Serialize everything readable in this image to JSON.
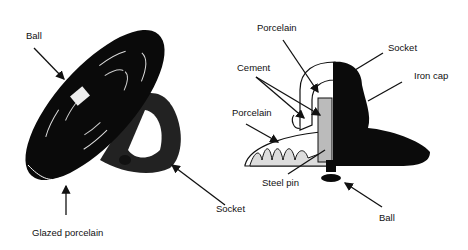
{
  "left_figure": {
    "title": "Suspension insulator (external view)",
    "labels": {
      "ball": "Ball",
      "glazed_porcelain": "Glazed porcelain",
      "socket": "Socket"
    }
  },
  "right_figure": {
    "title": "Suspension insulator (cross-section)",
    "labels": {
      "porcelain_top": "Porcelain",
      "socket": "Socket",
      "cement": "Cement",
      "iron_cap": "Iron cap",
      "porcelain_left": "Porcelain",
      "steel_pin": "Steel pin",
      "ball": "Ball"
    }
  }
}
